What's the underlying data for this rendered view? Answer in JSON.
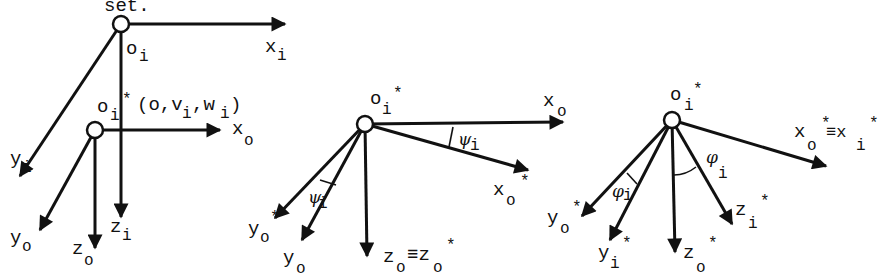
{
  "caption_fragment": "set.",
  "panels": [
    {
      "id": "panel-1",
      "origins": [
        {
          "name": "O",
          "sub": "i",
          "sup": ""
        },
        {
          "name": "O",
          "sub": "i",
          "sup": "*"
        }
      ],
      "annotation": "(o,v",
      "annotation_sub1": "i",
      "annotation_mid": ",w",
      "annotation_sub2": "i",
      "annotation_end": ")",
      "axes": [
        {
          "base": "x",
          "sub": "i",
          "sup": ""
        },
        {
          "base": "y",
          "sub": "i",
          "sup": ""
        },
        {
          "base": "z",
          "sub": "i",
          "sup": ""
        },
        {
          "base": "x",
          "sub": "o",
          "sup": ""
        },
        {
          "base": "y",
          "sub": "o",
          "sup": ""
        },
        {
          "base": "z",
          "sub": "o",
          "sup": ""
        }
      ]
    },
    {
      "id": "panel-2",
      "origin": {
        "name": "O",
        "sub": "i",
        "sup": "*"
      },
      "angle": {
        "symbol": "ψ",
        "sub": "i"
      },
      "axes": [
        {
          "base": "x",
          "sub": "o",
          "sup": ""
        },
        {
          "base": "x",
          "sub": "o",
          "sup": "*"
        },
        {
          "base": "y",
          "sub": "o",
          "sup": "*"
        },
        {
          "base": "y",
          "sub": "o",
          "sup": ""
        },
        {
          "base": "z",
          "sub": "o",
          "sup": "",
          "equiv": "≡z",
          "equiv_sub": "o",
          "equiv_sup": "*"
        }
      ]
    },
    {
      "id": "panel-3",
      "origin": {
        "name": "O",
        "sub": "i",
        "sup": "*"
      },
      "angle": {
        "symbol": "φ",
        "sub": "i"
      },
      "axes": [
        {
          "base": "x",
          "sub": "o",
          "sup": "*",
          "equiv": "≡x",
          "equiv_sub": "i",
          "equiv_sup": "*"
        },
        {
          "base": "y",
          "sub": "o",
          "sup": "*"
        },
        {
          "base": "y",
          "sub": "i",
          "sup": "*"
        },
        {
          "base": "z",
          "sub": "o",
          "sup": "*"
        },
        {
          "base": "z",
          "sub": "i",
          "sup": "*"
        }
      ]
    }
  ]
}
